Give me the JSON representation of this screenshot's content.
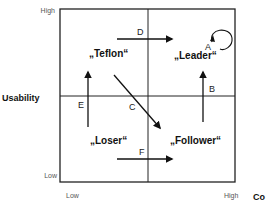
{
  "diagram": {
    "y_axis": {
      "title": "Usability",
      "high_label": "High",
      "low_label": "Low"
    },
    "x_axis": {
      "title": "Co",
      "high_label": "High",
      "low_label": "Low"
    },
    "quadrants": {
      "top_left": "„Teflon“",
      "top_right": "„Leader“",
      "bottom_left": "„Loser“",
      "bottom_right": "„Follower“"
    },
    "transitions": [
      {
        "id": "A",
        "label": "A",
        "from": "Leader",
        "to": "Leader",
        "type": "self-loop"
      },
      {
        "id": "B",
        "label": "B",
        "from": "Follower",
        "to": "Leader",
        "type": "up"
      },
      {
        "id": "C",
        "label": "C",
        "from": "Teflon",
        "to": "Follower",
        "type": "diagonal"
      },
      {
        "id": "D",
        "label": "D",
        "from": "Teflon",
        "to": "Leader",
        "type": "right"
      },
      {
        "id": "E",
        "label": "E",
        "from": "Loser",
        "to": "Teflon",
        "type": "up"
      },
      {
        "id": "F",
        "label": "F",
        "from": "Loser",
        "to": "Follower",
        "type": "right"
      }
    ]
  }
}
